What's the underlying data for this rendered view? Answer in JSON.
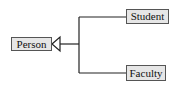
{
  "diagram": {
    "type": "uml-class-inheritance",
    "nodes": [
      {
        "id": "person",
        "label": "Person",
        "role": "superclass"
      },
      {
        "id": "student",
        "label": "Student",
        "role": "subclass"
      },
      {
        "id": "faculty",
        "label": "Faculty",
        "role": "subclass"
      }
    ],
    "edges": [
      {
        "from": "student",
        "to": "person",
        "kind": "generalization"
      },
      {
        "from": "faculty",
        "to": "person",
        "kind": "generalization"
      }
    ],
    "colors": {
      "node_fill": "#e6e6e6",
      "node_border": "#555555",
      "line": "#222222",
      "text": "#111111"
    }
  }
}
